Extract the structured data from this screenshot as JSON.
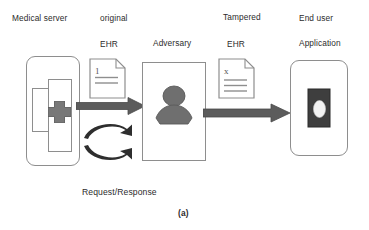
{
  "figure": {
    "caption": "(a)",
    "bottom_label": "Request/Response"
  },
  "labels": {
    "medical_server": "Medical server",
    "original": "original",
    "ehr_original": "EHR",
    "adversary": "Adversary",
    "tampered": "Tampered",
    "ehr_tampered": "EHR",
    "end_user": "End user",
    "application": "Application"
  },
  "documents": {
    "original_mark": "1",
    "tampered_mark": "x"
  },
  "icons": {
    "server": "server-cross-icon",
    "adversary": "person-silhouette-icon",
    "document_original": "document-icon",
    "document_tampered": "document-icon",
    "phone": "mobile-phone-icon",
    "flow_arrow_1": "right-arrow-icon",
    "flow_arrow_2": "right-arrow-icon",
    "request_arrow": "curved-right-arrow-icon",
    "response_arrow": "curved-right-arrow-icon"
  },
  "colors": {
    "outline": "#8e8e8e",
    "fill_gray": "#6e6e6e",
    "arrow_gray": "#595959",
    "text": "#2b2b2b",
    "background": "#ffffff",
    "phone_body": "#3a3a3a"
  }
}
